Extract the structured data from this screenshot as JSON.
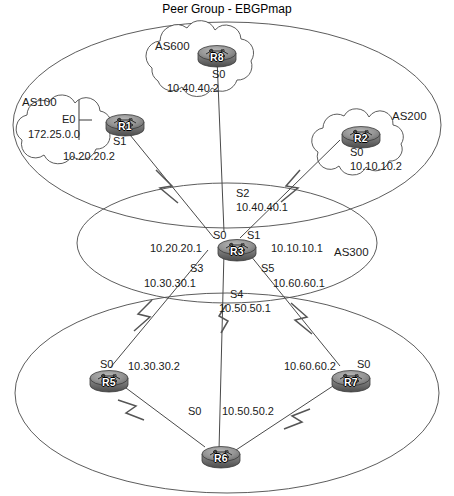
{
  "title": "Peer Group - EBGPmap",
  "clouds": [
    {
      "name": "AS600",
      "label_x": 155,
      "label_y": 40
    },
    {
      "name": "AS100",
      "label_x": 22,
      "label_y": 96
    },
    {
      "name": "AS200",
      "label_x": 392,
      "label_y": 110
    },
    {
      "name": "AS300",
      "label_x": 334,
      "label_y": 246
    }
  ],
  "routers": [
    {
      "id": "R8",
      "x": 196,
      "y": 45
    },
    {
      "id": "R1",
      "x": 104,
      "y": 114
    },
    {
      "id": "R2",
      "x": 340,
      "y": 126
    },
    {
      "id": "R3",
      "x": 216,
      "y": 239
    },
    {
      "id": "R5",
      "x": 88,
      "y": 370
    },
    {
      "id": "R7",
      "x": 330,
      "y": 370
    },
    {
      "id": "R6",
      "x": 200,
      "y": 446
    }
  ],
  "interfaces": [
    {
      "name": "port-r8-s0",
      "port": "S0",
      "ip": "10.40.40.2",
      "port_x": 212,
      "port_y": 68,
      "ip_x": 167,
      "ip_y": 82
    },
    {
      "name": "port-r1-e0",
      "port": "E0",
      "ip": "172.25.0.0",
      "port_x": 62,
      "port_y": 113,
      "ip_x": 28,
      "ip_y": 128
    },
    {
      "name": "port-r1-s1",
      "port": "S1",
      "ip": "10.20.20.2",
      "port_x": 113,
      "port_y": 135,
      "ip_x": 63,
      "ip_y": 150
    },
    {
      "name": "port-r2-s0",
      "port": "S0",
      "ip": "10.10.10.2",
      "port_x": 350,
      "port_y": 146,
      "ip_x": 350,
      "ip_y": 160
    },
    {
      "name": "port-r3-s2",
      "port": "S2",
      "ip": "10.40.40.1",
      "port_x": 236,
      "port_y": 187,
      "ip_x": 236,
      "ip_y": 201
    },
    {
      "name": "port-r3-s0",
      "port": "S0",
      "ip": "10.20.20.1",
      "port_x": 213,
      "port_y": 229,
      "ip_x": 150,
      "ip_y": 242
    },
    {
      "name": "port-r3-s1",
      "port": "S1",
      "ip": "10.10.10.1",
      "port_x": 247,
      "port_y": 229,
      "ip_x": 271,
      "ip_y": 242
    },
    {
      "name": "port-r3-s3",
      "port": "S3",
      "ip": "10.30.30.1",
      "port_x": 190,
      "port_y": 262,
      "ip_x": 144,
      "ip_y": 277
    },
    {
      "name": "port-r3-s5",
      "port": "S5",
      "ip": "10.60.60.1",
      "port_x": 261,
      "port_y": 262,
      "ip_x": 273,
      "ip_y": 277
    },
    {
      "name": "port-r3-s4",
      "port": "S4",
      "ip": "10.50.50.1",
      "port_x": 230,
      "port_y": 288,
      "ip_x": 219,
      "ip_y": 302
    },
    {
      "name": "port-r5-s0",
      "port": "S0",
      "ip": "10.30.30.2",
      "port_x": 100,
      "port_y": 358,
      "ip_x": 128,
      "ip_y": 360
    },
    {
      "name": "port-r7-s0",
      "port": "S0",
      "ip": "10.60.60.2",
      "port_x": 357,
      "port_y": 358,
      "ip_x": 284,
      "ip_y": 360
    },
    {
      "name": "port-r6-s0",
      "port": "S0",
      "ip": "10.50.50.2",
      "port_x": 188,
      "port_y": 405,
      "ip_x": 222,
      "ip_y": 405
    }
  ],
  "colors": {
    "line": "#3a3a3a",
    "router_body": "#8c8c8c",
    "router_dark": "#4a4a4a",
    "text": "#1a1a1a"
  }
}
